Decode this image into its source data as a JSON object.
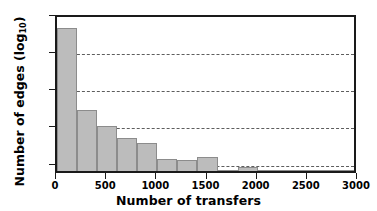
{
  "chart_data": {
    "type": "bar",
    "title": "",
    "subtitle": "",
    "xlabel": "Number of transfers",
    "ylabel": "Number of edges (log10)",
    "ylabel_text": "Number of edges (log",
    "ylabel_sub": "10",
    "ylabel_close": ")",
    "yscale": "log",
    "ylim": [
      5.6,
      100000
    ],
    "xlim": [
      0,
      3000
    ],
    "grid": "horizontal-dashed",
    "legend": "none",
    "bin_width": 200,
    "categories": [
      "0-200",
      "200-400",
      "400-600",
      "600-800",
      "800-1000",
      "1000-1200",
      "1200-1400",
      "1400-1600",
      "1600-1800",
      "1800-2000",
      "2000-2200",
      "2200-2400",
      "2400-2600",
      "2600-2800",
      "2800-3000"
    ],
    "bin_starts": [
      0,
      200,
      400,
      600,
      800,
      1000,
      1200,
      1400,
      1600,
      1800,
      2000,
      2200,
      2400,
      2600,
      2800
    ],
    "values": [
      40000,
      250,
      90,
      42,
      32,
      12,
      11,
      13,
      5,
      7,
      3,
      4,
      2,
      5,
      3
    ],
    "xticks": [
      {
        "value": 0,
        "label": "0"
      },
      {
        "value": 500,
        "label": "500"
      },
      {
        "value": 1000,
        "label": "1000"
      },
      {
        "value": 1500,
        "label": "1500"
      },
      {
        "value": 2000,
        "label": "2000"
      },
      {
        "value": 2500,
        "label": "2500"
      },
      {
        "value": 3000,
        "label": "3000"
      }
    ],
    "yticks": [
      {
        "value": 10,
        "mantissa": "10",
        "exponent": "1"
      },
      {
        "value": 100,
        "mantissa": "10",
        "exponent": "2"
      },
      {
        "value": 1000,
        "mantissa": "10",
        "exponent": "3"
      },
      {
        "value": 10000,
        "mantissa": "10",
        "exponent": "4"
      },
      {
        "value": 100000,
        "mantissa": "10",
        "exponent": "5"
      }
    ],
    "gridlines": [
      10,
      100,
      1000,
      10000
    ],
    "colors": {
      "bar_fill": "#bcbcbc",
      "bar_edge": "#8c8c8c",
      "axis": "#1a1a1a",
      "grid": "#5d5d5d",
      "background": "#ffffff",
      "text": "#000000"
    }
  }
}
